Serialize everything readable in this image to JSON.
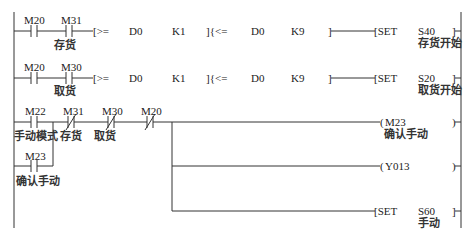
{
  "diagram": {
    "type": "PLC ladder diagram",
    "rungs": [
      {
        "contacts": [
          {
            "addr": "M20",
            "type": "NO",
            "comment": ""
          },
          {
            "addr": "M31",
            "type": "NO",
            "comment": "存货"
          }
        ],
        "compare1": {
          "open": "[>=",
          "op1": "D0",
          "op2": "K1"
        },
        "compare2": {
          "open": "]{<=",
          "op1": "D0",
          "op2": "K9",
          "close": "]"
        },
        "output": {
          "instr": "[SET",
          "addr": "S40",
          "close": "]",
          "comment": "存货开始"
        }
      },
      {
        "contacts": [
          {
            "addr": "M20",
            "type": "NO",
            "comment": ""
          },
          {
            "addr": "M30",
            "type": "NO",
            "comment": "取货"
          }
        ],
        "compare1": {
          "open": "[>=",
          "op1": "D0",
          "op2": "K1"
        },
        "compare2": {
          "open": "]{<=",
          "op1": "D0",
          "op2": "K9",
          "close": "]"
        },
        "output": {
          "instr": "[SET",
          "addr": "S20",
          "close": "]",
          "comment": "取货开始"
        }
      },
      {
        "contacts": [
          {
            "addr": "M22",
            "type": "NO",
            "comment": "手动模式"
          },
          {
            "addr": "M31",
            "type": "NC",
            "comment": "存货"
          },
          {
            "addr": "M30",
            "type": "NC",
            "comment": "取货"
          },
          {
            "addr": "M20",
            "type": "NC",
            "comment": ""
          }
        ],
        "parallel": {
          "addr": "M23",
          "type": "NO",
          "comment": "确认手动"
        },
        "outputs": [
          {
            "instr": "(",
            "addr": "M23",
            "close": ")",
            "comment": "确认手动"
          },
          {
            "instr": "(",
            "addr": "Y013",
            "close": ")",
            "comment": ""
          },
          {
            "instr": "[SET",
            "addr": "S60",
            "close": "]",
            "comment": "手动"
          }
        ]
      }
    ]
  }
}
